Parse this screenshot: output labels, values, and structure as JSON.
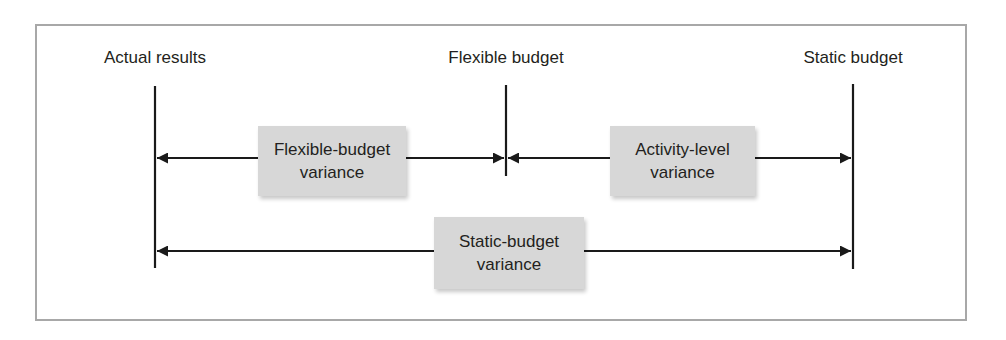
{
  "diagram": {
    "title": "",
    "markers": [
      {
        "id": "actual",
        "label": "Actual results",
        "x": 155
      },
      {
        "id": "flexible",
        "label": "Flexible budget",
        "x": 506
      },
      {
        "id": "static",
        "label": "Static budget",
        "x": 853
      }
    ],
    "variances": [
      {
        "id": "flexible-budget-variance",
        "line1": "Flexible-budget",
        "line2": "variance",
        "from": "actual",
        "to": "flexible"
      },
      {
        "id": "activity-level-variance",
        "line1": "Activity-level",
        "line2": "variance",
        "from": "flexible",
        "to": "static"
      },
      {
        "id": "static-budget-variance",
        "line1": "Static-budget",
        "line2": "variance",
        "from": "actual",
        "to": "static"
      }
    ],
    "colors": {
      "line": "#1a1a1a",
      "box_fill": "#d7d7d7",
      "frame": "#a8a8a8"
    }
  }
}
